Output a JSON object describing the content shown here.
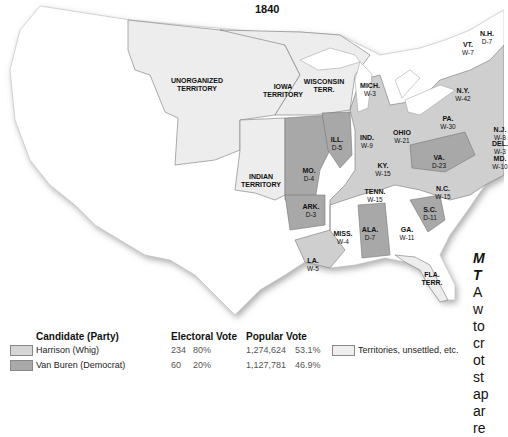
{
  "title": "1840",
  "regions": [
    {
      "name": "UNORGANIZED TERRITORY",
      "abbr": "UNORGANIZED",
      "line2": "TERRITORY",
      "x": 197,
      "y": 77
    },
    {
      "name": "IOWA TERRITORY",
      "abbr": "IOWA",
      "line2": "TERRITORY",
      "x": 283,
      "y": 85
    },
    {
      "name": "WISCONSIN TERR.",
      "abbr": "WISCONSIN",
      "line2": "TERR.",
      "x": 324,
      "y": 80
    },
    {
      "name": "INDIAN TERRITORY",
      "abbr": "INDIAN",
      "line2": "TERRITORY",
      "x": 261,
      "y": 175
    },
    {
      "name": "FLA. TERR.",
      "abbr": "FLA.",
      "line2": "TERR.",
      "x": 432,
      "y": 271
    }
  ],
  "states": [
    {
      "abbr": "MICH.",
      "vote": "W-3",
      "x": 370,
      "y": 82
    },
    {
      "abbr": "N.Y.",
      "vote": "W-42",
      "x": 463,
      "y": 87
    },
    {
      "abbr": "PA.",
      "vote": "W-30",
      "x": 448,
      "y": 117
    },
    {
      "abbr": "OHIO",
      "vote": "W-21",
      "x": 402,
      "y": 130
    },
    {
      "abbr": "IND.",
      "vote": "W-9",
      "x": 367,
      "y": 135
    },
    {
      "abbr": "ILL.",
      "vote": "D-5",
      "x": 337,
      "y": 137
    },
    {
      "abbr": "MO.",
      "vote": "D-4",
      "x": 309,
      "y": 168
    },
    {
      "abbr": "KY.",
      "vote": "W-15",
      "x": 383,
      "y": 163
    },
    {
      "abbr": "VA.",
      "vote": "D-23",
      "x": 439,
      "y": 155
    },
    {
      "abbr": "TENN.",
      "vote": "W-15",
      "x": 375,
      "y": 190
    },
    {
      "abbr": "N.C.",
      "vote": "W-15",
      "x": 443,
      "y": 188
    },
    {
      "abbr": "ARK.",
      "vote": "D-3",
      "x": 311,
      "y": 205
    },
    {
      "abbr": "S.C.",
      "vote": "D-11",
      "x": 430,
      "y": 208
    },
    {
      "abbr": "MISS.",
      "vote": "W-4",
      "x": 343,
      "y": 232
    },
    {
      "abbr": "ALA.",
      "vote": "D-7",
      "x": 370,
      "y": 228
    },
    {
      "abbr": "GA.",
      "vote": "W-11",
      "x": 407,
      "y": 228
    },
    {
      "abbr": "LA.",
      "vote": "W-5",
      "x": 313,
      "y": 258
    },
    {
      "abbr": "VT.",
      "vote": "W-7",
      "x": 468,
      "y": 44
    },
    {
      "abbr": "N.H.",
      "vote": "D-7",
      "x": 487,
      "y": 35
    },
    {
      "abbr": "N.J.",
      "vote": "W-8",
      "x": 499,
      "y": 125
    },
    {
      "abbr": "DEL.",
      "vote": "W-3",
      "x": 500,
      "y": 140
    },
    {
      "abbr": "MD.",
      "vote": "W-10",
      "x": 500,
      "y": 155
    }
  ],
  "sidebar": {
    "heading_line1": "M",
    "heading_line2": "T",
    "lines": [
      "A",
      "w",
      "to",
      "cr",
      "ot",
      "st",
      "ap",
      "ar",
      "re"
    ]
  },
  "legend": {
    "headers": {
      "candidate": "Candidate (Party)",
      "electoral": "Electoral Vote",
      "popular": "Popular Vote"
    },
    "rows": [
      {
        "candidate": "Harrison (Whig)",
        "ev": "234",
        "ev_pct": "80%",
        "pv": "1,274,624",
        "pv_pct": "53.1%",
        "color": "#d6d6d6"
      },
      {
        "candidate": "Van Buren (Democrat)",
        "ev": "60",
        "ev_pct": "20%",
        "pv": "1,127,781",
        "pv_pct": "46.9%",
        "color": "#a9a9a9"
      }
    ],
    "territories_label": "Territories, unsettled, etc.",
    "territories_color": "#efefef"
  }
}
